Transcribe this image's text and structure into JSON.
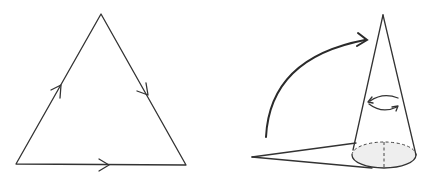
{
  "figure": {
    "left_panel": {
      "description": "Equilateral triangle with directional arrows on each side (closed loop path)",
      "arrows": [
        "left-side-up",
        "right-side-down",
        "bottom-right"
      ]
    },
    "right_panel": {
      "description": "Flat triangular sector being rolled up into a cone, with rotation arrow around cone axis",
      "elements": [
        "curved-arrow",
        "cone",
        "rotation-arrow",
        "shaded-base-ellipse",
        "dashed-axis",
        "flat-sector"
      ]
    },
    "colors": {
      "line": "#333333",
      "base_fill": "#eeeeee",
      "background": "#ffffff"
    }
  }
}
